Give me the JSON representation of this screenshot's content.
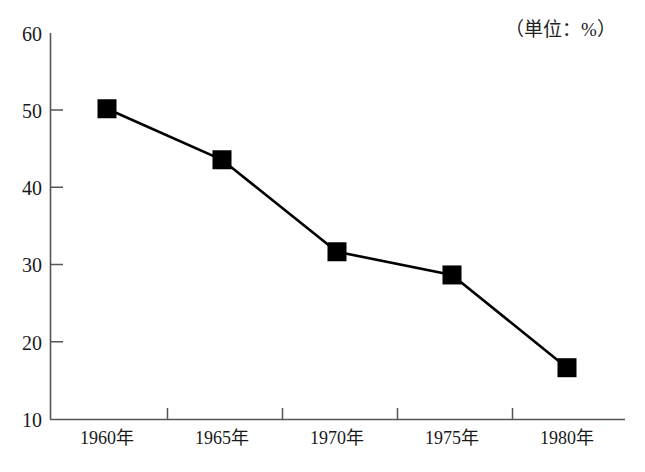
{
  "annotation": {
    "unit_note": "（単位：%）"
  },
  "chart_data": {
    "type": "line",
    "title": "",
    "subtitle": "",
    "xlabel": "",
    "ylabel": "",
    "unit_note": "（単位：%）",
    "categories": [
      "1960年",
      "1965年",
      "1970年",
      "1975年",
      "1980年"
    ],
    "values": [
      50.2,
      43.6,
      31.7,
      28.7,
      16.7
    ],
    "series": [
      {
        "name": "",
        "values": [
          50.2,
          43.6,
          31.7,
          28.7,
          16.7
        ]
      }
    ],
    "ylim": [
      10,
      60
    ],
    "ytick_labels": [
      "10",
      "20",
      "30",
      "40",
      "50",
      "60"
    ],
    "ytick_values": [
      10,
      20,
      30,
      40,
      50,
      60
    ],
    "xtick_labels": [
      "1960年",
      "1965年",
      "1970年",
      "1975年",
      "1980年"
    ],
    "grid": false,
    "legend": false,
    "legend_position": "none",
    "marker": "square",
    "line_color": "#000000",
    "marker_color": "#000000",
    "axis_color": "#555555",
    "background_color": "#ffffff"
  }
}
